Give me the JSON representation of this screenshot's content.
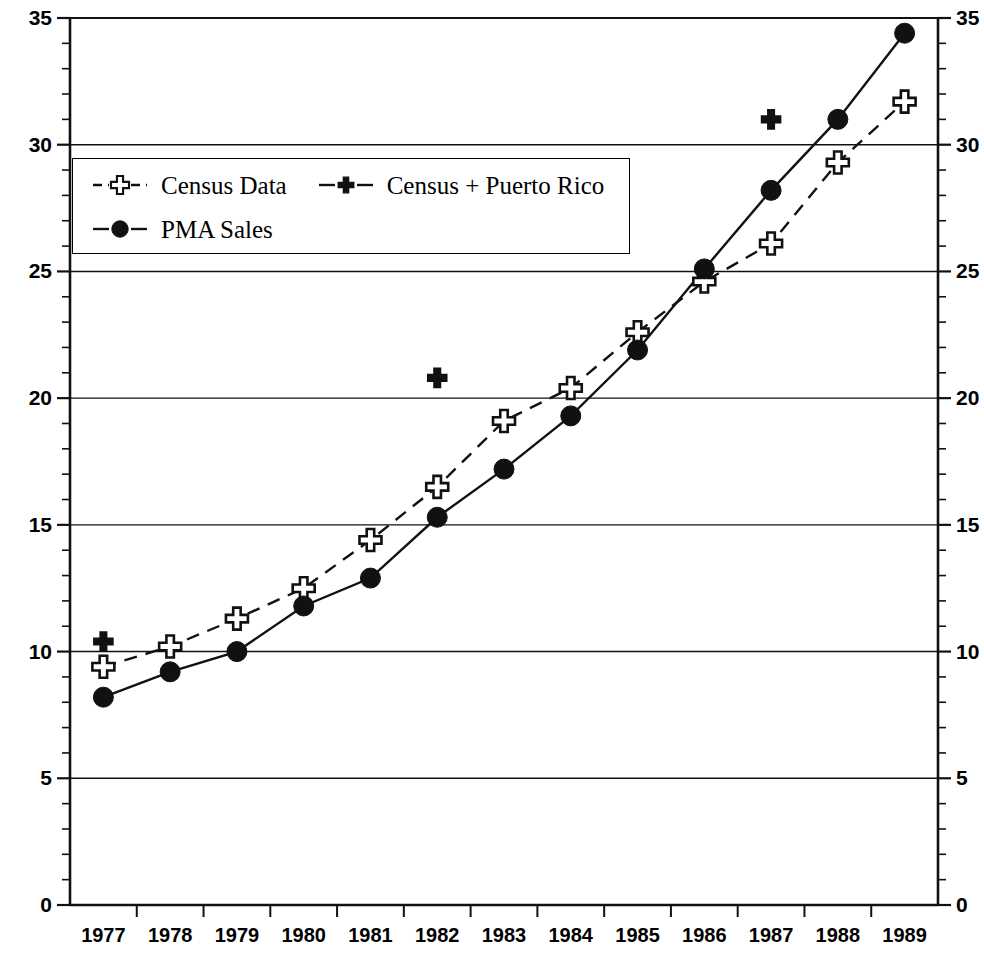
{
  "chart_data": {
    "type": "line",
    "title": "",
    "xlabel": "",
    "ylabel": "",
    "categories": [
      "1977",
      "1978",
      "1979",
      "1980",
      "1981",
      "1982",
      "1983",
      "1984",
      "1985",
      "1986",
      "1987",
      "1988",
      "1989"
    ],
    "ylim": [
      0,
      35
    ],
    "y_major_step": 5,
    "y_minor_step": 1,
    "grid": "horizontal major gridlines",
    "dual_y_axis": true,
    "legend_position": "upper left inside plot",
    "y_ticks": [
      0,
      5,
      10,
      15,
      20,
      25,
      30,
      35
    ],
    "y_tick_labels": [
      "0",
      "5",
      "10",
      "15",
      "20",
      "25",
      "30",
      "35"
    ],
    "series": [
      {
        "name": "Census Data",
        "marker": "open-cross",
        "line": "dashed",
        "color": "#000000",
        "values": [
          9.4,
          10.2,
          11.3,
          12.5,
          14.4,
          16.5,
          19.1,
          20.4,
          22.6,
          24.6,
          26.1,
          29.3,
          31.7
        ]
      },
      {
        "name": "Census + Puerto Rico",
        "marker": "filled-cross",
        "line": "none",
        "color": "#000000",
        "values": [
          10.4,
          null,
          null,
          null,
          null,
          20.8,
          null,
          null,
          null,
          null,
          31.0,
          null,
          null
        ]
      },
      {
        "name": "PMA Sales",
        "marker": "filled-circle",
        "line": "solid",
        "color": "#000000",
        "values": [
          8.2,
          9.2,
          10.0,
          11.8,
          12.9,
          15.3,
          17.2,
          19.3,
          21.9,
          25.1,
          28.2,
          31.0,
          34.4
        ]
      }
    ]
  },
  "legend": {
    "entries": [
      {
        "label": "Census Data",
        "key": "open-cross-dashed"
      },
      {
        "label": "Census + Puerto Rico",
        "key": "filled-cross-solid"
      },
      {
        "label": "PMA Sales",
        "key": "filled-circle-solid"
      }
    ]
  },
  "axes": {
    "left_axis_name": "left-value-axis",
    "right_axis_name": "right-value-axis",
    "bottom_axis_name": "year-axis"
  }
}
